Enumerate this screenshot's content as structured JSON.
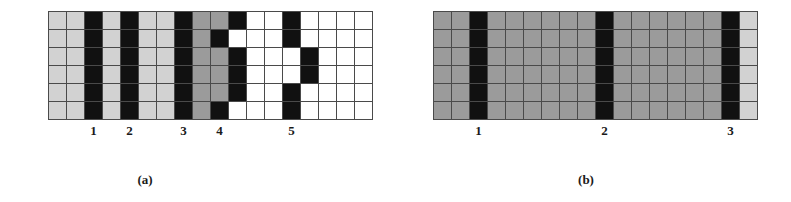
{
  "figure": {
    "background": "#ffffff",
    "colors": {
      "white": "#ffffff",
      "light_gray": "#d2d2d2",
      "medium_gray": "#9b9b9b",
      "black": "#111111",
      "grid_line": "#4a4a4a"
    }
  },
  "chart_data": {
    "type": "heatmap",
    "title": "",
    "panels": [
      {
        "id": "a",
        "caption": "(a)",
        "rows": 6,
        "cols": 18,
        "cell_px": 17,
        "legend": {
          "W": "white",
          "L": "light_gray",
          "G": "medium_gray",
          "K": "black"
        },
        "cells": [
          [
            "L",
            "L",
            "K",
            "L",
            "K",
            "L",
            "L",
            "K",
            "G",
            "G",
            "K",
            "W",
            "W",
            "K",
            "W",
            "W",
            "W",
            "W"
          ],
          [
            "L",
            "L",
            "K",
            "L",
            "K",
            "L",
            "L",
            "K",
            "G",
            "K",
            "W",
            "W",
            "W",
            "K",
            "W",
            "W",
            "W",
            "W"
          ],
          [
            "L",
            "L",
            "K",
            "L",
            "K",
            "L",
            "L",
            "K",
            "G",
            "G",
            "K",
            "W",
            "W",
            "W",
            "K",
            "W",
            "W",
            "W"
          ],
          [
            "L",
            "L",
            "K",
            "L",
            "K",
            "L",
            "L",
            "K",
            "G",
            "G",
            "K",
            "W",
            "W",
            "W",
            "K",
            "W",
            "W",
            "W"
          ],
          [
            "L",
            "L",
            "K",
            "L",
            "K",
            "L",
            "L",
            "K",
            "G",
            "G",
            "K",
            "W",
            "W",
            "K",
            "W",
            "W",
            "W",
            "W"
          ],
          [
            "L",
            "L",
            "K",
            "L",
            "K",
            "L",
            "L",
            "K",
            "G",
            "K",
            "W",
            "W",
            "W",
            "K",
            "W",
            "W",
            "W",
            "W"
          ]
        ],
        "markers": [
          {
            "label": "1",
            "col": 2
          },
          {
            "label": "2",
            "col": 4
          },
          {
            "label": "3",
            "col": 7
          },
          {
            "label": "4",
            "col": 9
          },
          {
            "label": "5",
            "col": 13
          }
        ]
      },
      {
        "id": "b",
        "caption": "(b)",
        "rows": 6,
        "cols": 18,
        "cell_px": 17,
        "legend": {
          "W": "white",
          "L": "light_gray",
          "G": "medium_gray",
          "K": "black"
        },
        "cells": [
          [
            "G",
            "G",
            "K",
            "G",
            "G",
            "G",
            "G",
            "G",
            "G",
            "K",
            "G",
            "G",
            "G",
            "G",
            "G",
            "G",
            "K",
            "L"
          ],
          [
            "G",
            "G",
            "K",
            "G",
            "G",
            "G",
            "G",
            "G",
            "G",
            "K",
            "G",
            "G",
            "G",
            "G",
            "G",
            "G",
            "K",
            "L"
          ],
          [
            "G",
            "G",
            "K",
            "G",
            "G",
            "G",
            "G",
            "G",
            "G",
            "K",
            "G",
            "G",
            "G",
            "G",
            "G",
            "G",
            "K",
            "L"
          ],
          [
            "G",
            "G",
            "K",
            "G",
            "G",
            "G",
            "G",
            "G",
            "G",
            "K",
            "G",
            "G",
            "G",
            "G",
            "G",
            "G",
            "K",
            "L"
          ],
          [
            "G",
            "G",
            "K",
            "G",
            "G",
            "G",
            "G",
            "G",
            "G",
            "K",
            "G",
            "G",
            "G",
            "G",
            "G",
            "G",
            "K",
            "L"
          ],
          [
            "G",
            "G",
            "K",
            "G",
            "G",
            "G",
            "G",
            "G",
            "G",
            "K",
            "G",
            "G",
            "G",
            "G",
            "G",
            "G",
            "K",
            "L"
          ]
        ],
        "markers": [
          {
            "label": "1",
            "col": 2
          },
          {
            "label": "2",
            "col": 9
          },
          {
            "label": "3",
            "col": 16
          }
        ]
      }
    ]
  }
}
